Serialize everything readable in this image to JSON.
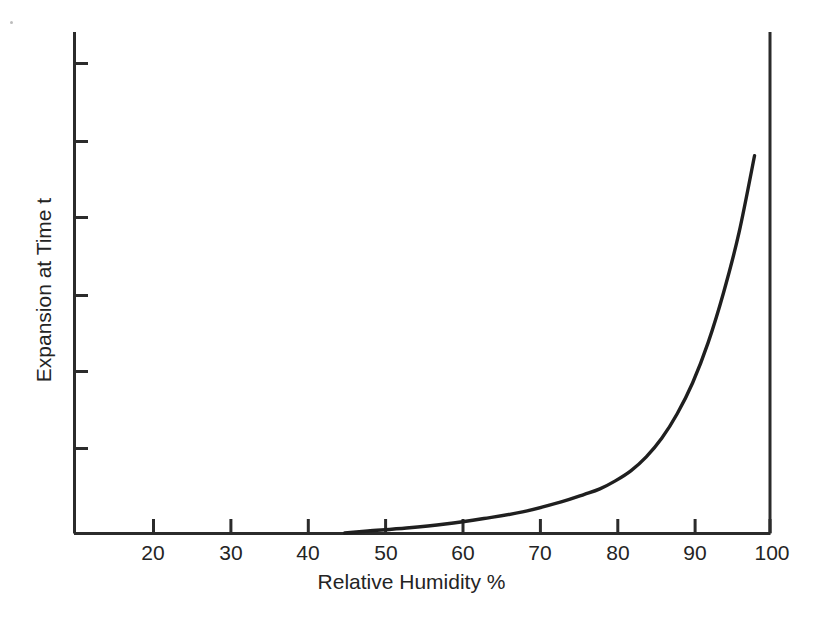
{
  "chart_data": {
    "type": "line",
    "title": "",
    "xlabel": "Relative Humidity %",
    "ylabel": "Expansion at Time t",
    "xlim": [
      12,
      102
    ],
    "ylim": [
      0,
      1
    ],
    "grid": false,
    "legend": null,
    "x_tick_labels": [
      "20",
      "30",
      "40",
      "50",
      "60",
      "70",
      "80",
      "90",
      "100"
    ],
    "x_ticks": [
      20,
      30,
      40,
      50,
      60,
      70,
      80,
      90,
      100
    ],
    "y_ticks": [
      0.167,
      0.333,
      0.5,
      0.667,
      0.833,
      1.0
    ],
    "y_tick_labels": [
      "",
      "",
      "",
      "",
      "",
      ""
    ],
    "series": [
      {
        "name": "Expansion",
        "color": "#1f1f1f",
        "x": [
          47,
          50,
          55,
          60,
          65,
          70,
          75,
          78,
          80,
          82,
          84,
          86,
          88,
          90,
          92,
          94,
          96,
          98,
          100
        ],
        "y": [
          0.0,
          0.004,
          0.01,
          0.018,
          0.029,
          0.042,
          0.062,
          0.077,
          0.088,
          0.104,
          0.124,
          0.152,
          0.189,
          0.238,
          0.3,
          0.38,
          0.48,
          0.6,
          0.753
        ]
      }
    ]
  },
  "axes": {
    "x_title": "Relative Humidity %",
    "y_title": "Expansion at Time t"
  },
  "ticks": {
    "x": [
      {
        "label": "20",
        "value": 20
      },
      {
        "label": "30",
        "value": 30
      },
      {
        "label": "40",
        "value": 40
      },
      {
        "label": "50",
        "value": 50
      },
      {
        "label": "60",
        "value": 60
      },
      {
        "label": "70",
        "value": 70
      },
      {
        "label": "80",
        "value": 80
      },
      {
        "label": "90",
        "value": 90
      },
      {
        "label": "100",
        "value": 100
      }
    ]
  },
  "colors": {
    "axis": "#2b2b2b",
    "curve": "#1f1f1f",
    "background": "#ffffff",
    "text": "#242424"
  }
}
